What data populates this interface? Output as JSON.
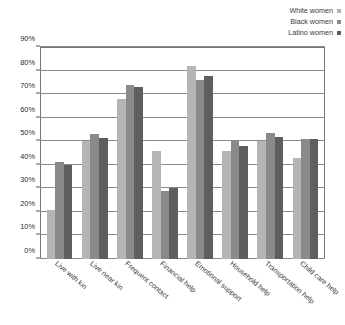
{
  "chart_data": {
    "type": "bar",
    "title": "",
    "xlabel": "",
    "ylabel": "",
    "ylim": [
      0,
      90
    ],
    "grid": true,
    "legend_position": "top-right",
    "categories": [
      "Live with kin",
      "Live near kin",
      "Frequent contact",
      "Financial help",
      "Emotional support",
      "Household help",
      "Transportation help",
      "Child care help"
    ],
    "ytick_labels": [
      "0%",
      "10%",
      "20%",
      "30%",
      "40%",
      "50%",
      "60%",
      "70%",
      "80%",
      "90%"
    ],
    "ytick_values": [
      0,
      10,
      20,
      30,
      40,
      50,
      60,
      70,
      80,
      90
    ],
    "series": [
      {
        "name": "White women",
        "color": "#b5b5b5",
        "values": [
          21,
          50,
          68,
          46,
          82,
          46,
          50,
          43
        ]
      },
      {
        "name": "Black women",
        "color": "#8a8a8a",
        "values": [
          41,
          53,
          74,
          29,
          76,
          50,
          53.5,
          51
        ]
      },
      {
        "name": "Latino women",
        "color": "#5e5e5e",
        "values": [
          40,
          51.5,
          73,
          30,
          77.5,
          48,
          52,
          51
        ]
      }
    ]
  },
  "colors": {
    "plot_border": "#777777",
    "gridline": "#8a8a8a",
    "background": "#ffffff",
    "text": "#2b2b2b"
  }
}
